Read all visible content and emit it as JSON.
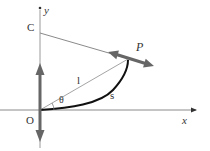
{
  "diagram": {
    "labels": {
      "y_axis": "y",
      "x_axis": "x",
      "origin": "O",
      "point_c": "C",
      "point_p": "P",
      "length": "l",
      "arc": "s",
      "angle": "θ"
    },
    "colors": {
      "thin_line": "#9a9a9a",
      "axis_line": "#8a8a8a",
      "thick_arrow": "#666666",
      "arc": "#111111",
      "text": "#333333"
    },
    "points": {
      "O": [
        40,
        110
      ],
      "C": [
        40,
        33
      ],
      "P": [
        126,
        58
      ]
    }
  }
}
